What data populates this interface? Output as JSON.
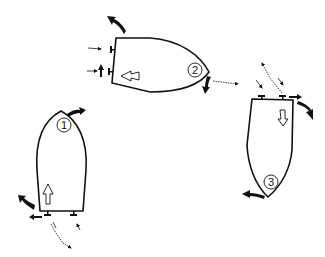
{
  "diagram": {
    "colors": {
      "ink": "#111111",
      "background": "#ffffff"
    },
    "boats": [
      {
        "id": "boat-1",
        "label": "1",
        "heading": "up",
        "motion_arrow": "forward (hollow arrow pointing to bow)"
      },
      {
        "id": "boat-2",
        "label": "2",
        "heading": "right",
        "motion_arrow": "astern (hollow arrow pointing to stern)"
      },
      {
        "id": "boat-3",
        "label": "3",
        "heading": "down",
        "motion_arrow": "forward (hollow arrow pointing to bow)"
      }
    ],
    "legend_icons": [
      "hull-outline",
      "propeller-icon",
      "bold-curved-arrow-icon",
      "wavy-propwash-arrow-icon",
      "thin-thrust-arrow-icon",
      "hollow-direction-arrow-icon"
    ]
  }
}
